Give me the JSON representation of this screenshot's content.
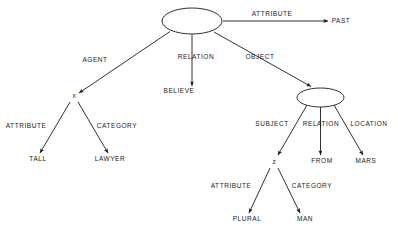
{
  "diagram": {
    "type": "semantic-network",
    "nodes": [
      {
        "id": "root",
        "kind": "ellipse",
        "label": "",
        "cx": 192,
        "cy": 21,
        "rx": 30,
        "ry": 13
      },
      {
        "id": "object",
        "kind": "ellipse",
        "label": "",
        "cx": 320.5,
        "cy": 97.5,
        "rx": 23.5,
        "ry": 9.5
      },
      {
        "id": "x",
        "kind": "variable",
        "label": "x",
        "x": 74,
        "y": 98
      },
      {
        "id": "z",
        "kind": "variable",
        "label": "z",
        "x": 274,
        "y": 164
      },
      {
        "id": "past",
        "kind": "leaf",
        "label": "PAST",
        "x": 341,
        "y": 23
      },
      {
        "id": "believe",
        "kind": "leaf",
        "label": "BELIEVE",
        "x": 179,
        "y": 93
      },
      {
        "id": "tall",
        "kind": "leaf",
        "label": "TALL",
        "x": 38,
        "y": 161
      },
      {
        "id": "lawyer",
        "kind": "leaf",
        "label": "LAWYER",
        "x": 110,
        "y": 161
      },
      {
        "id": "from",
        "kind": "leaf",
        "label": "FROM",
        "x": 322,
        "y": 163
      },
      {
        "id": "mars",
        "kind": "leaf",
        "label": "MARS",
        "x": 366,
        "y": 163
      },
      {
        "id": "plural",
        "kind": "leaf",
        "label": "PLURAL",
        "x": 247,
        "y": 221
      },
      {
        "id": "man",
        "kind": "leaf",
        "label": "MAN",
        "x": 305,
        "y": 221
      }
    ],
    "edges": [
      {
        "id": "e-root-past",
        "from": "root",
        "to": "past",
        "label": "ATTRIBUTE",
        "label_x": 272,
        "label_y": 16
      },
      {
        "id": "e-root-believe",
        "from": "root",
        "to": "believe",
        "label": "RELATION",
        "label_x": 196,
        "label_y": 59
      },
      {
        "id": "e-root-object",
        "from": "root",
        "to": "object",
        "label": "OBJECT",
        "label_x": 260,
        "label_y": 59
      },
      {
        "id": "e-root-x",
        "from": "root",
        "to": "x",
        "label": "AGENT",
        "label_x": 95,
        "label_y": 62
      },
      {
        "id": "e-x-tall",
        "from": "x",
        "to": "tall",
        "label": "ATTRIBUTE",
        "label_x": 26,
        "label_y": 128
      },
      {
        "id": "e-x-lawyer",
        "from": "x",
        "to": "lawyer",
        "label": "CATEGORY",
        "label_x": 117,
        "label_y": 128
      },
      {
        "id": "e-object-z",
        "from": "object",
        "to": "z",
        "label": "SUBJECT",
        "label_x": 272,
        "label_y": 126
      },
      {
        "id": "e-object-from",
        "from": "object",
        "to": "from",
        "label": "RELATION",
        "label_x": 321,
        "label_y": 126
      },
      {
        "id": "e-object-mars",
        "from": "object",
        "to": "mars",
        "label": "LOCATION",
        "label_x": 369,
        "label_y": 126
      },
      {
        "id": "e-z-plural",
        "from": "z",
        "to": "plural",
        "label": "ATTRIBUTE",
        "label_x": 231,
        "label_y": 188
      },
      {
        "id": "e-z-man",
        "from": "z",
        "to": "man",
        "label": "CATEGORY",
        "label_x": 312,
        "label_y": 188
      }
    ]
  }
}
